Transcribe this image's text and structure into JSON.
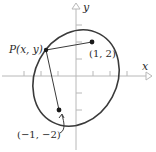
{
  "diagram": {
    "type": "ellipse-with-foci",
    "axes": {
      "x_label": "x",
      "y_label": "y",
      "tick_count_each_side": 3
    },
    "point_p": {
      "label": "P(x, y)"
    },
    "focus_1": {
      "label": "(1, 2)",
      "x": 1,
      "y": 2
    },
    "focus_2": {
      "label": "(−1, −2)",
      "x": -1,
      "y": -2
    },
    "colors": {
      "ellipse": "#3a3a3a",
      "axes": "#b8b8b8",
      "segments": "#3a3a3a",
      "points": "#1a1a1a",
      "text": "#2a2a2a"
    }
  }
}
